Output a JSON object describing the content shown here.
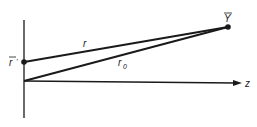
{
  "diagram": {
    "axis_label_z": "z",
    "point_source_label": "r",
    "point_source_prime": "'",
    "point_field_label": "Y",
    "line_r_label": "r",
    "line_r0_label": "r",
    "line_r0_subscript": "0",
    "colors": {
      "ink": "#1a1a1a",
      "background": "#ffffff"
    }
  }
}
